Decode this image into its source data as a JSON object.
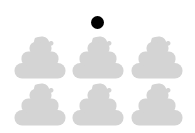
{
  "canvas": {
    "width": 195,
    "height": 133,
    "background_color": "#ffffff"
  },
  "marker": {
    "icon": "filled-circle-dot",
    "color": "#000000",
    "center_x": 97,
    "center_y": 22,
    "diameter": 13
  },
  "grid": {
    "icon": "pile-of-poo-silhouette",
    "shape_color": "#d4d4d4",
    "columns": 3,
    "rows": 2,
    "count": 6,
    "cell_width": 52,
    "cell_height": 44,
    "column_x": [
      14,
      72,
      131
    ],
    "row_y": [
      35,
      82
    ],
    "items": [
      {
        "index": 1,
        "row": 1,
        "column": 1,
        "x": 14,
        "y": 35
      },
      {
        "index": 2,
        "row": 1,
        "column": 2,
        "x": 72,
        "y": 35
      },
      {
        "index": 3,
        "row": 1,
        "column": 3,
        "x": 131,
        "y": 35
      },
      {
        "index": 4,
        "row": 2,
        "column": 1,
        "x": 14,
        "y": 82
      },
      {
        "index": 5,
        "row": 2,
        "column": 2,
        "x": 72,
        "y": 82
      },
      {
        "index": 6,
        "row": 2,
        "column": 3,
        "x": 131,
        "y": 82
      }
    ]
  }
}
